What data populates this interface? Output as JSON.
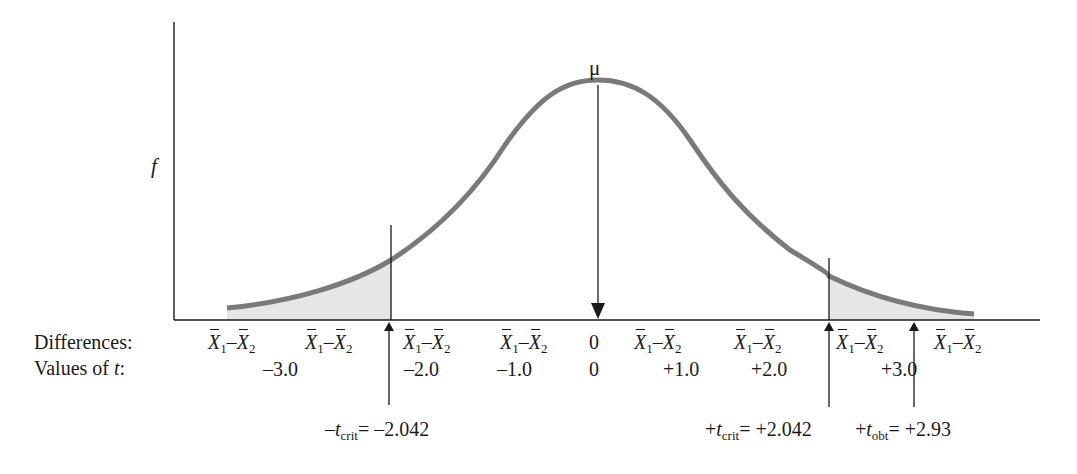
{
  "axis": {
    "y_label": "f",
    "mean_label": "μ"
  },
  "rows": {
    "differences_label": "Differences:",
    "t_values_label_prefix": "Values of ",
    "t_values_label_var": "t",
    "t_values_label_suffix": ":"
  },
  "difference_term": {
    "x1": "X",
    "sub1": "1",
    "minus": "–",
    "x2": "X",
    "sub2": "2"
  },
  "differences": [
    {
      "kind": "term",
      "x": 208
    },
    {
      "kind": "term",
      "x": 305
    },
    {
      "kind": "term",
      "x": 403
    },
    {
      "kind": "term",
      "x": 500
    },
    {
      "kind": "zero",
      "x": 589,
      "text": "0"
    },
    {
      "kind": "term",
      "x": 634
    },
    {
      "kind": "term",
      "x": 734
    },
    {
      "kind": "term",
      "x": 836
    },
    {
      "kind": "term",
      "x": 934
    }
  ],
  "t_values": [
    {
      "text": "–3.0",
      "x": 263
    },
    {
      "text": "–2.0",
      "x": 404
    },
    {
      "text": "–1.0",
      "x": 497
    },
    {
      "text": "0",
      "x": 589
    },
    {
      "text": "+1.0",
      "x": 663
    },
    {
      "text": "+2.0",
      "x": 751
    },
    {
      "text": "+3.0",
      "x": 881
    }
  ],
  "markers": {
    "neg_crit": {
      "prefix": "–",
      "var": "t",
      "sub": "crit",
      "value": "= –2.042"
    },
    "pos_crit": {
      "prefix": "+",
      "var": "t",
      "sub": "crit",
      "value": "= +2.042"
    },
    "obt": {
      "prefix": "+",
      "var": "t",
      "sub": "obt",
      "value": "= +2.93"
    }
  },
  "colors": {
    "curve": "#7a7a7a",
    "shade": "#e6e6e6",
    "lines": "#1a1a1a"
  },
  "chart_data": {
    "type": "area",
    "title": "",
    "distribution": "t",
    "xlabel": "Values of t",
    "ylabel": "f",
    "x_ticks": [
      -3.0,
      -2.0,
      -1.0,
      0,
      1.0,
      2.0,
      3.0
    ],
    "mean": 0,
    "critical_values": [
      -2.042,
      2.042
    ],
    "t_obtained": 2.93,
    "shaded_regions": [
      {
        "from": "-inf",
        "to": -2.042,
        "label": "lower rejection region"
      },
      {
        "from": 2.042,
        "to": "inf",
        "label": "upper rejection region"
      }
    ],
    "annotations": [
      "μ",
      "–t_crit = –2.042",
      "+t_crit = +2.042",
      "+t_obt = +2.93"
    ]
  }
}
